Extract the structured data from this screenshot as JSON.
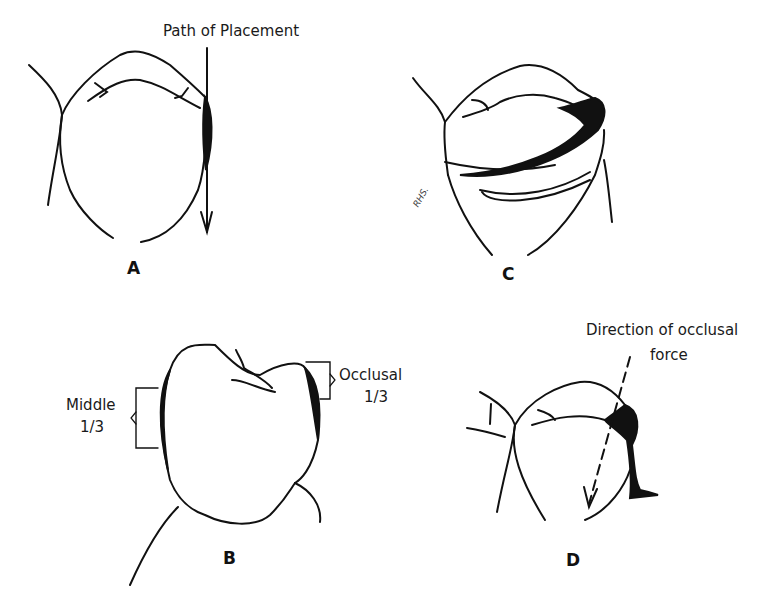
{
  "figure": {
    "panels": [
      {
        "id": "A",
        "label": "A",
        "annotation": "Path of Placement"
      },
      {
        "id": "B",
        "label": "B",
        "annotation_left_line1": "Middle",
        "annotation_left_line2": "1/3",
        "annotation_right_line1": "Occlusal",
        "annotation_right_line2": "1/3"
      },
      {
        "id": "C",
        "label": "C",
        "signature": "RHS."
      },
      {
        "id": "D",
        "label": "D",
        "annotation_line1": "Direction of occlusal",
        "annotation_line2": "force"
      }
    ]
  },
  "colors": {
    "ink": "#111111",
    "background": "#ffffff"
  }
}
